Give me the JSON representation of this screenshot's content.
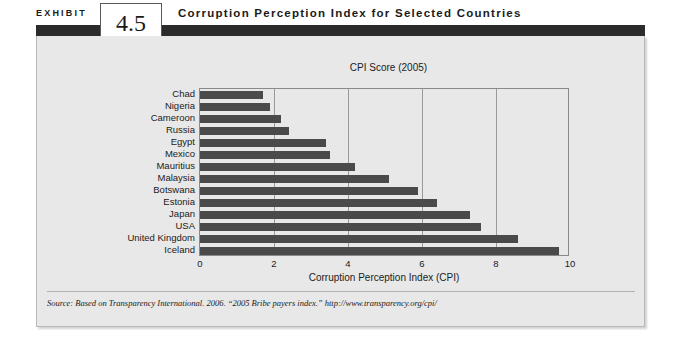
{
  "exhibit": {
    "label": "EXHIBIT",
    "number": "4.5",
    "title": "Corruption Perception Index for Selected Countries"
  },
  "source": {
    "text": "Source:  Based on Transparency International. 2006. “2005 Bribe payers index.” http://www.transparency.org/cpi/"
  },
  "chart_data": {
    "type": "bar",
    "orientation": "horizontal",
    "title": "CPI Score (2005)",
    "xlabel": "Corruption Perception Index (CPI)",
    "ylabel": "",
    "xlim": [
      0,
      10
    ],
    "xticks": [
      0,
      2,
      4,
      6,
      8,
      10
    ],
    "xtick_labels": [
      "0",
      "2",
      "4",
      "6",
      "8",
      "10"
    ],
    "grid": "vertical",
    "legend": "none",
    "bar_color": "#4a4a4a",
    "categories": [
      "Chad",
      "Nigeria",
      "Cameroon",
      "Russia",
      "Egypt",
      "Mexico",
      "Mauritius",
      "Malaysia",
      "Botswana",
      "Estonia",
      "Japan",
      "USA",
      "United Kingdom",
      "Iceland"
    ],
    "values": [
      1.7,
      1.9,
      2.2,
      2.4,
      3.4,
      3.5,
      4.2,
      5.1,
      5.9,
      6.4,
      7.3,
      7.6,
      8.6,
      9.7
    ]
  }
}
